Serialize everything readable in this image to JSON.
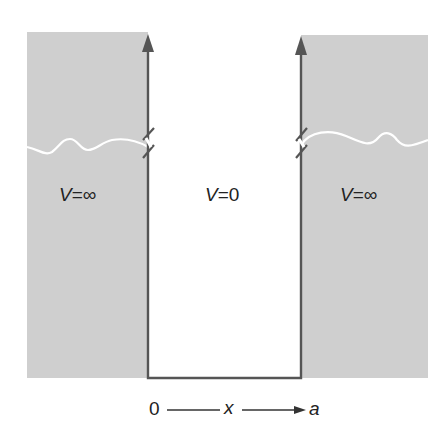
{
  "diagram": {
    "regions": [
      {
        "name": "left",
        "label_var": "V",
        "label_eq": "=",
        "label_val": "∞"
      },
      {
        "name": "inside",
        "label_var": "V",
        "label_eq": "=",
        "label_val": "0"
      },
      {
        "name": "right",
        "label_var": "V",
        "label_eq": "=",
        "label_val": "∞"
      }
    ],
    "axis": {
      "start": "0",
      "variable": "x",
      "end": "a"
    },
    "colors": {
      "wall_fill": "#cfcfcf",
      "wall_line": "#555555",
      "wave_line": "#ffffff",
      "background": "#ffffff"
    }
  }
}
